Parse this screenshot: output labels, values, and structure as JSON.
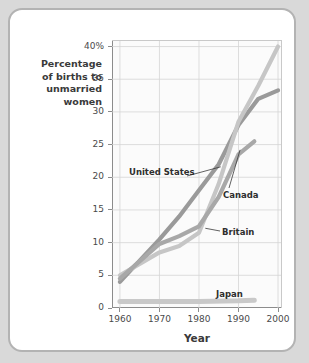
{
  "figure": {
    "background_color": "#ffffff",
    "frame_color": "#b3b3b3",
    "page_color": "#d9d9d9"
  },
  "axes": {
    "y_label_lines": [
      "Percentage",
      "of births to",
      "unmarried",
      "women"
    ],
    "x_label": "Year",
    "y_ticks": [
      "0",
      "5",
      "10",
      "15",
      "20",
      "25",
      "30",
      "35",
      "40%"
    ],
    "x_ticks": [
      "1960",
      "1970",
      "1980",
      "1990",
      "2000"
    ]
  },
  "series_labels": {
    "united_states": "United States",
    "canada": "Canada",
    "britain": "Britain",
    "japan": "Japan"
  },
  "chart_data": {
    "type": "line",
    "title": "",
    "xlabel": "Year",
    "ylabel": "Percentage of births to unmarried women",
    "xlim": [
      1958,
      2001
    ],
    "ylim": [
      0,
      41
    ],
    "x_ticks": [
      1960,
      1970,
      1980,
      1990,
      2000
    ],
    "y_ticks": [
      0,
      5,
      10,
      15,
      20,
      25,
      30,
      35,
      40
    ],
    "y_tick_labels": [
      "0",
      "5",
      "10",
      "15",
      "20",
      "25",
      "30",
      "35",
      "40%"
    ],
    "grid": true,
    "legend": "inline-callout-labels",
    "series": [
      {
        "name": "United States",
        "color": "#9a9a9a",
        "x": [
          1960,
          1970,
          1975,
          1980,
          1985,
          1990,
          1995,
          2000
        ],
        "values": [
          4.0,
          10.5,
          14.0,
          18.0,
          22.0,
          28.0,
          32.0,
          33.3
        ]
      },
      {
        "name": "Britain",
        "color": "#c6c6c6",
        "x": [
          1960,
          1970,
          1975,
          1980,
          1985,
          1990,
          1995,
          2000
        ],
        "values": [
          5.0,
          8.5,
          9.5,
          11.5,
          19.0,
          28.5,
          34.0,
          40.0
        ]
      },
      {
        "name": "Canada",
        "color": "#a8a8a8",
        "x": [
          1960,
          1970,
          1975,
          1980,
          1985,
          1990,
          1994
        ],
        "values": [
          4.5,
          9.8,
          11.0,
          12.5,
          17.0,
          23.5,
          25.5
        ]
      },
      {
        "name": "Japan",
        "color": "#c9c9c9",
        "x": [
          1960,
          1970,
          1980,
          1990,
          1994
        ],
        "values": [
          1.0,
          1.0,
          1.0,
          1.1,
          1.2
        ]
      }
    ]
  }
}
